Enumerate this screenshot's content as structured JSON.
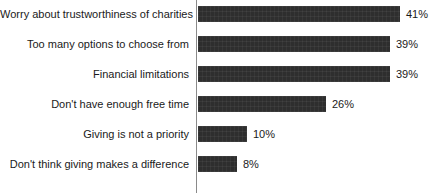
{
  "chart_data": {
    "type": "bar",
    "orientation": "horizontal",
    "title": "",
    "subtitle": "",
    "xlabel": "",
    "ylabel": "",
    "grid": false,
    "legend": false,
    "axis_line": "vertical-left",
    "value_suffix": "%",
    "xlim": [
      0,
      41
    ],
    "categories": [
      "Worry about trustworthiness of charities",
      "Too many options to choose from",
      "Financial limitations",
      "Don't have enough free time",
      "Giving is not a priority",
      "Don't think giving makes a difference"
    ],
    "values": [
      41,
      39,
      39,
      26,
      10,
      8
    ],
    "value_labels": [
      "41%",
      "39%",
      "39%",
      "26%",
      "10%",
      "8%"
    ],
    "colors": {
      "bar": "#2e2e2e",
      "axis": "#8a8a8a",
      "text": "#1a1a1a",
      "background": "#ffffff"
    }
  },
  "rows": [
    {
      "label": "Worry about trustworthiness of charities",
      "value": 41,
      "value_label": "41%"
    },
    {
      "label": "Too many options to choose from",
      "value": 39,
      "value_label": "39%"
    },
    {
      "label": "Financial limitations",
      "value": 39,
      "value_label": "39%"
    },
    {
      "label": "Don't have enough free time",
      "value": 26,
      "value_label": "26%"
    },
    {
      "label": "Giving is not a priority",
      "value": 10,
      "value_label": "10%"
    },
    {
      "label": "Don't think giving makes a difference",
      "value": 8,
      "value_label": "8%"
    }
  ]
}
